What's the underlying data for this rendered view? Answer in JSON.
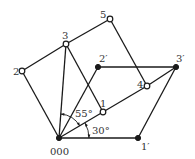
{
  "diagram": {
    "nodes": [
      {
        "id": "000",
        "label": "000",
        "x": 59,
        "y": 138,
        "style": "filled",
        "lx": 50,
        "ly": 155
      },
      {
        "id": "1",
        "label": "1",
        "x": 103,
        "y": 112,
        "style": "open",
        "lx": 100,
        "ly": 107
      },
      {
        "id": "2",
        "label": "2",
        "x": 22,
        "y": 71,
        "style": "open",
        "lx": 13,
        "ly": 75
      },
      {
        "id": "3",
        "label": "3",
        "x": 66,
        "y": 44,
        "style": "open",
        "lx": 62,
        "ly": 39
      },
      {
        "id": "4",
        "label": "4",
        "x": 147,
        "y": 86,
        "style": "open",
        "lx": 137,
        "ly": 88
      },
      {
        "id": "5",
        "label": "5",
        "x": 110,
        "y": 19,
        "style": "open",
        "lx": 100,
        "ly": 18
      },
      {
        "id": "1'",
        "label": "1′",
        "x": 138,
        "y": 138,
        "style": "filled",
        "lx": 141,
        "ly": 150
      },
      {
        "id": "2'",
        "label": "2′",
        "x": 98,
        "y": 67,
        "style": "filled",
        "lx": 99,
        "ly": 62
      },
      {
        "id": "3'",
        "label": "3′",
        "x": 176,
        "y": 67,
        "style": "filled",
        "lx": 176,
        "ly": 62
      }
    ],
    "edges": [
      [
        "000",
        "2"
      ],
      [
        "2",
        "3"
      ],
      [
        "3",
        "5"
      ],
      [
        "5",
        "4"
      ],
      [
        "3",
        "000"
      ],
      [
        "3",
        "1"
      ],
      [
        "1",
        "000"
      ],
      [
        "1",
        "4"
      ],
      [
        "4",
        "3'"
      ],
      [
        "2'",
        "3'"
      ],
      [
        "2'",
        "000"
      ],
      [
        "3'",
        "1'"
      ],
      [
        "1'",
        "000"
      ]
    ],
    "angles": [
      {
        "label": "55°",
        "from_deg": 30,
        "to_deg": 85.7,
        "radius": 24,
        "lx": 75,
        "ly": 117
      },
      {
        "label": "30°",
        "from_deg": 0,
        "to_deg": 30,
        "radius": 30,
        "lx": 92,
        "ly": 134
      }
    ]
  }
}
